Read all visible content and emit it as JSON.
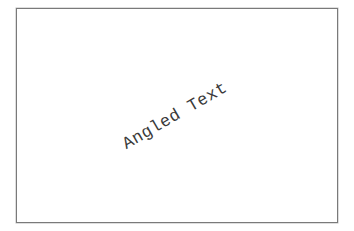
{
  "canvas": {
    "border_color": "#7a7a7a",
    "background": "#ffffff"
  },
  "text": {
    "content": "Angled Text",
    "rotation_deg": -30,
    "color": "#3a3a3a"
  }
}
